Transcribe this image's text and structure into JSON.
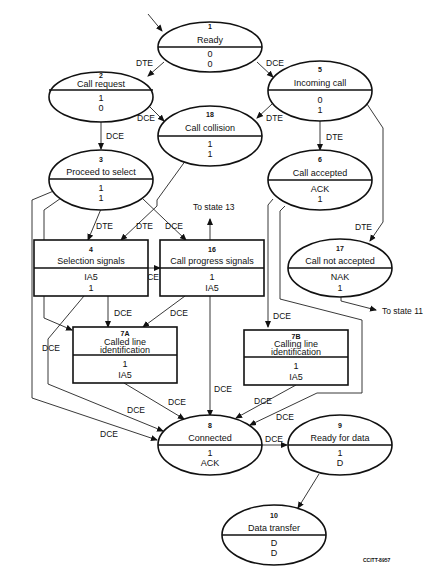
{
  "diagram": {
    "type": "state-transition-diagram",
    "caption": "CCITT-8957",
    "states": [
      {
        "id": "1",
        "name": "Ready",
        "values": [
          "0",
          "0"
        ],
        "shape": "ellipse"
      },
      {
        "id": "2",
        "name": "Call request",
        "values": [
          "1",
          "0"
        ],
        "shape": "ellipse"
      },
      {
        "id": "5",
        "name": "Incoming call",
        "values": [
          "0",
          "1"
        ],
        "shape": "ellipse"
      },
      {
        "id": "18",
        "name": "Call collision",
        "values": [
          "1",
          "1"
        ],
        "shape": "ellipse"
      },
      {
        "id": "3",
        "name": "Proceed to select",
        "values": [
          "1",
          "1"
        ],
        "shape": "ellipse"
      },
      {
        "id": "6",
        "name": "Call accepted",
        "values": [
          "ACK",
          "1"
        ],
        "shape": "ellipse"
      },
      {
        "id": "4",
        "name": "Selection signals",
        "values": [
          "IA5",
          "1"
        ],
        "shape": "rect"
      },
      {
        "id": "16",
        "name": "Call progress signals",
        "values": [
          "1",
          "IA5"
        ],
        "shape": "rect"
      },
      {
        "id": "17",
        "name": "Call not accepted",
        "values": [
          "NAK",
          "1"
        ],
        "shape": "ellipse"
      },
      {
        "id": "7A",
        "name_lines": [
          "Called line",
          "identification"
        ],
        "values": [
          "1",
          "IA5"
        ],
        "shape": "rect"
      },
      {
        "id": "7B",
        "name_lines": [
          "Calling line",
          "identification"
        ],
        "values": [
          "1",
          "IA5"
        ],
        "shape": "rect"
      },
      {
        "id": "8",
        "name": "Connected",
        "values": [
          "1",
          "ACK"
        ],
        "shape": "ellipse"
      },
      {
        "id": "9",
        "name": "Ready for data",
        "values": [
          "1",
          "D"
        ],
        "shape": "ellipse"
      },
      {
        "id": "10",
        "name": "Data transfer",
        "values": [
          "D",
          "D"
        ],
        "shape": "ellipse"
      }
    ],
    "transitions": [
      {
        "from": "1",
        "to": "2",
        "label": "DTE"
      },
      {
        "from": "1",
        "to": "5",
        "label": "DCE"
      },
      {
        "from": "2",
        "to": "18",
        "label": "DCE"
      },
      {
        "from": "2",
        "to": "3",
        "label": "DCE"
      },
      {
        "from": "5",
        "to": "18",
        "label": "DTE"
      },
      {
        "from": "5",
        "to": "6",
        "label": "DTE"
      },
      {
        "from": "5",
        "to": "17",
        "label": "DTE"
      },
      {
        "from": "3",
        "to": "4",
        "label": "DTE"
      },
      {
        "from": "18",
        "to": "4",
        "label": "DTE"
      },
      {
        "from": "3",
        "to": "16",
        "label": "DCE"
      },
      {
        "from": "4",
        "to": "16",
        "label": "DCE"
      },
      {
        "from": "4",
        "to": "7A",
        "label": "DCE"
      },
      {
        "from": "16",
        "to": "7A",
        "label": "DCE"
      },
      {
        "from": "3",
        "to": "7A",
        "label": "DCE"
      },
      {
        "from": "6",
        "to": "7B",
        "label": "DCE"
      },
      {
        "from": "16",
        "to": "8",
        "label": "DCE"
      },
      {
        "from": "7A",
        "to": "8",
        "label": "DCE"
      },
      {
        "from": "7B",
        "to": "8",
        "label": "DCE"
      },
      {
        "from": "6",
        "to": "8",
        "label": "DCE"
      },
      {
        "from": "3",
        "to": "8",
        "label": "DCE"
      },
      {
        "from": "4",
        "to": "8",
        "label": "DCE"
      },
      {
        "from": "8",
        "to": "9",
        "label": "DCE"
      },
      {
        "from": "9",
        "to": "10",
        "label": ""
      }
    ],
    "external_notes": {
      "to_state_13": "To state 13",
      "to_state_11": "To state 11"
    },
    "labels": {
      "dte": "DTE",
      "dce": "DCE"
    }
  }
}
